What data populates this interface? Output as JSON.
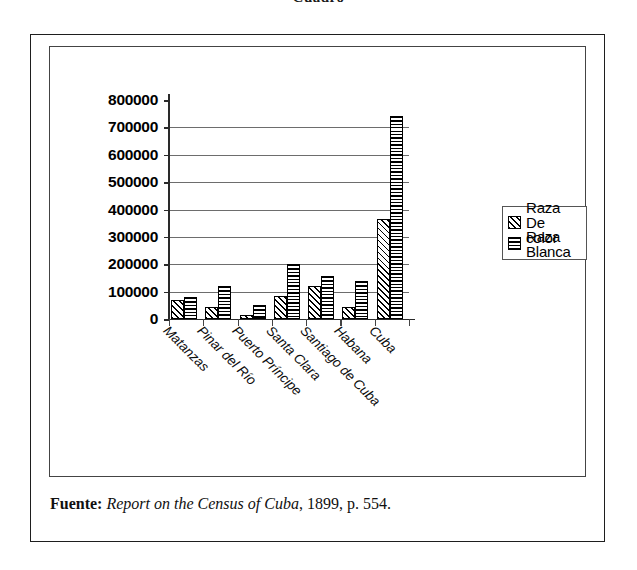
{
  "page": {
    "title_fragment": "Cuadro"
  },
  "chart_data": {
    "type": "bar",
    "title": "",
    "subtitle": "",
    "xlabel": "",
    "ylabel": "",
    "ylim": [
      0,
      800000
    ],
    "ytick_step": 100000,
    "ytick_labels": [
      "800000",
      "700000",
      "600000",
      "500000",
      "400000",
      "300000",
      "200000",
      "100000",
      "0"
    ],
    "ytick_values": [
      800000,
      700000,
      600000,
      500000,
      400000,
      300000,
      200000,
      100000,
      0
    ],
    "grid": true,
    "grid_axis": "y",
    "legend_position": "right",
    "categories": [
      "Matanzas",
      "Pinar del Río",
      "Puerto Príncipe",
      "Santa Clara",
      "Santiago de Cuba",
      "Habana",
      "Cuba"
    ],
    "series": [
      {
        "name": "Raza De color",
        "pattern": "diagonal-hatch",
        "values": [
          68000,
          44000,
          14000,
          85000,
          120000,
          45000,
          365000
        ]
      },
      {
        "name": "Raza Blanca",
        "pattern": "horizontal-lines",
        "values": [
          80000,
          122000,
          53000,
          200000,
          157000,
          139000,
          740000
        ]
      }
    ]
  },
  "legend": {
    "entries": [
      {
        "label": "Raza De color",
        "swatch": "diagonal-hatch-swatch"
      },
      {
        "label": "Raza Blanca",
        "swatch": "horizontal-lines-swatch"
      }
    ]
  },
  "source": {
    "label": "Fuente:",
    "work": "Report on the Census of Cuba",
    "rest": ", 1899, p. 554."
  },
  "colors": {
    "ink": "#000000",
    "frame": "#1e1e1e",
    "gridline": "#6d6d6d",
    "background": "#ffffff"
  }
}
